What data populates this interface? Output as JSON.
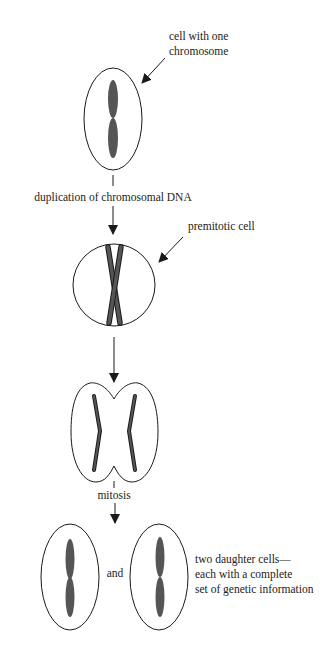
{
  "diagram": {
    "colors": {
      "outline": "#1a1a1a",
      "chromosome": "#555555",
      "text": "#222222",
      "background": "#ffffff"
    },
    "labels": {
      "cell_with_one_chromosome": {
        "line1": "cell with one",
        "line2": "chromosome"
      },
      "duplication": "duplication of chromosomal DNA",
      "premitotic_cell": "premitotic cell",
      "mitosis": "mitosis",
      "and": "and",
      "daughter_cells": {
        "line1": "two daughter cells—",
        "line2": "each with a complete",
        "line3": "set of genetic information"
      }
    },
    "stages": [
      {
        "id": "initial-cell",
        "shape": "ellipse",
        "chromosomes": 1
      },
      {
        "id": "premitotic-cell",
        "shape": "circle",
        "chromosomes": 1,
        "state": "duplicated (X shape)"
      },
      {
        "id": "dividing-cell",
        "shape": "pinched ellipse",
        "chromosomes": 2,
        "state": "separating"
      },
      {
        "id": "daughter-cells",
        "shape": "two ellipses",
        "chromosomes": 2
      }
    ]
  }
}
